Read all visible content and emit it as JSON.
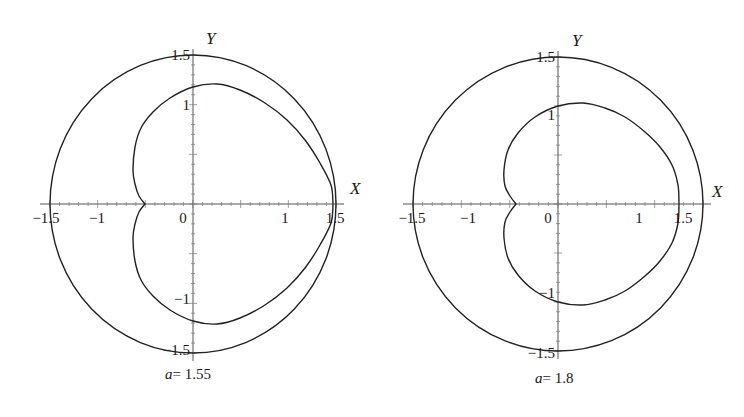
{
  "chart_data": [
    {
      "type": "line",
      "title": "",
      "caption": {
        "var": "a",
        "eq": "= 1.55"
      },
      "xlabel": "X",
      "ylabel": "Y",
      "xlim": [
        -1.6,
        1.6
      ],
      "ylim": [
        -1.55,
        1.55
      ],
      "grid": false,
      "x_ticks": [
        "-1.5",
        "-1",
        "0",
        "1",
        "1.5"
      ],
      "y_ticks": [
        "1.5",
        "1",
        "-1",
        "-1.5"
      ],
      "series": [
        {
          "name": "outer circle",
          "shape": "circle",
          "radius": 1.5
        },
        {
          "name": "inner curve",
          "shape": "closed-curve-with-cusp",
          "points_units": [
            [
              1.45,
              0
            ],
            [
              1.32,
              0.41
            ],
            [
              0.98,
              0.86
            ],
            [
              0.25,
              1.23
            ],
            [
              0,
              1.2
            ],
            [
              -0.42,
              0.94
            ],
            [
              -0.6,
              0.58
            ],
            [
              -0.63,
              0.34
            ],
            [
              -0.57,
              0.1
            ],
            [
              -0.5,
              0
            ]
          ]
        }
      ],
      "px": {
        "origin": [
          193,
          204
        ],
        "rx": 143,
        "ry": 149,
        "inner_upper": [
          [
            333,
            204
          ],
          [
            331,
            185
          ],
          [
            320,
            163
          ],
          [
            305,
            140
          ],
          [
            287,
            120
          ],
          [
            265,
            103
          ],
          [
            240,
            90
          ],
          [
            217,
            84
          ],
          [
            193,
            87
          ],
          [
            170,
            98
          ],
          [
            153,
            112
          ],
          [
            141,
            128
          ],
          [
            135,
            147
          ],
          [
            133,
            170
          ],
          [
            135,
            184
          ],
          [
            139,
            196
          ],
          [
            145,
            204
          ]
        ],
        "x_tick_labels": [
          {
            "t": "−1.5",
            "x": 46
          },
          {
            "t": "−1",
            "x": 97
          },
          {
            "t": "0",
            "x": 183
          },
          {
            "t": "1",
            "x": 285
          },
          {
            "t": "1.5",
            "x": 335
          }
        ],
        "y_tick_labels": [
          {
            "t": "1.5",
            "y": 60
          },
          {
            "t": "1",
            "y": 110
          },
          {
            "t": "−1",
            "y": 304
          },
          {
            "t": "−1.5",
            "y": 355
          }
        ],
        "x_label_pos": [
          350,
          194
        ],
        "y_label_pos": [
          206,
          44
        ],
        "caption_pos": [
          165,
          380
        ]
      }
    },
    {
      "type": "line",
      "title": "",
      "caption": {
        "var": "a",
        "eq": "= 1.8"
      },
      "xlabel": "X",
      "ylabel": "Y",
      "xlim": [
        -1.7,
        1.7
      ],
      "ylim": [
        -1.55,
        1.55
      ],
      "grid": false,
      "x_ticks": [
        "-1.5",
        "-1",
        "0",
        "1",
        "1.5"
      ],
      "y_ticks": [
        "1.5",
        "1",
        "-1",
        "-1.5"
      ],
      "series": [
        {
          "name": "outer circle",
          "shape": "circle",
          "radius": 1.5
        },
        {
          "name": "inner curve",
          "shape": "closed-curve-with-cusp",
          "points_units": [
            [
              1.38,
              0
            ],
            [
              1.3,
              0.3
            ],
            [
              1.0,
              0.72
            ],
            [
              0.28,
              1.05
            ],
            [
              0,
              1.02
            ],
            [
              -0.5,
              0.64
            ],
            [
              -0.6,
              0.36
            ],
            [
              -0.53,
              0.12
            ],
            [
              -0.46,
              0
            ]
          ]
        }
      ],
      "px": {
        "origin": [
          558,
          204
        ],
        "rx": 145,
        "ry": 147,
        "inner_upper": [
          [
            679,
            204
          ],
          [
            678,
            185
          ],
          [
            672,
            165
          ],
          [
            660,
            147
          ],
          [
            645,
            132
          ],
          [
            625,
            117
          ],
          [
            605,
            108
          ],
          [
            583,
            103
          ],
          [
            558,
            106
          ],
          [
            535,
            117
          ],
          [
            518,
            133
          ],
          [
            508,
            150
          ],
          [
            504,
            170
          ],
          [
            505,
            186
          ],
          [
            510,
            196
          ],
          [
            516,
            204
          ]
        ],
        "x_tick_labels": [
          {
            "t": "−1.5",
            "x": 412
          },
          {
            "t": "−1",
            "x": 468
          },
          {
            "t": "0",
            "x": 548
          },
          {
            "t": "1",
            "x": 639
          },
          {
            "t": "1.5",
            "x": 683
          }
        ],
        "y_tick_labels": [
          {
            "t": "1.5",
            "y": 62
          },
          {
            "t": "1",
            "y": 120
          },
          {
            "t": "−1",
            "y": 298
          },
          {
            "t": "−1.5",
            "y": 358
          }
        ],
        "x_label_pos": [
          712,
          197
        ],
        "y_label_pos": [
          572,
          46
        ],
        "caption_pos": [
          535,
          384
        ]
      }
    }
  ]
}
